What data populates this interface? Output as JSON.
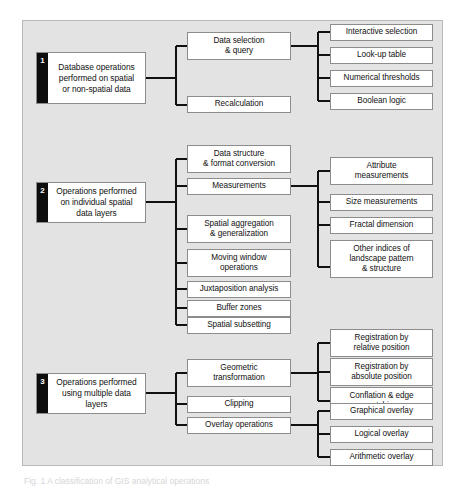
{
  "figure": {
    "caption": "Fig. 1  A classification of GIS analytical operations",
    "background_color": "#e3e3e3",
    "panel_border_color": "#b9b9b9",
    "node_fill": "#ffffff",
    "node_border": "#8c8c8c",
    "tab_color": "#0d0d0d",
    "connector_color": "#111111"
  },
  "sections": [
    {
      "number": "1",
      "title": "Database operations\nperformed on spatial\nor non-spatial data",
      "mid": [
        {
          "label": "Data selection\n& query"
        },
        {
          "label": "Recalculation"
        }
      ],
      "right": [
        {
          "label": "Interactive selection"
        },
        {
          "label": "Look-up table"
        },
        {
          "label": "Numerical thresholds"
        },
        {
          "label": "Boolean logic"
        }
      ]
    },
    {
      "number": "2",
      "title": "Operations performed\non individual spatial\ndata layers",
      "mid": [
        {
          "label": "Data structure\n& format conversion"
        },
        {
          "label": "Measurements"
        },
        {
          "label": "Spatial aggregation\n& generalization"
        },
        {
          "label": "Moving window\noperations"
        },
        {
          "label": "Juxtaposition analysis"
        },
        {
          "label": "Buffer zones"
        },
        {
          "label": "Spatial subsetting"
        }
      ],
      "right": [
        {
          "label": "Attribute\nmeasurements"
        },
        {
          "label": "Size measurements"
        },
        {
          "label": "Fractal dimension"
        },
        {
          "label": "Other indices of\nlandscape pattern\n& structure"
        }
      ]
    },
    {
      "number": "3",
      "title": "Operations performed\nusing multiple data\nlayers",
      "mid": [
        {
          "label": "Geometric\ntransformation"
        },
        {
          "label": "Clipping"
        },
        {
          "label": "Overlay operations"
        }
      ],
      "right": [
        {
          "label": "Registration by\nrelative position"
        },
        {
          "label": "Registration by\nabsolute position"
        },
        {
          "label": "Conflation & edge\nmatching"
        },
        {
          "label": "Graphical overlay"
        },
        {
          "label": "Logical overlay"
        },
        {
          "label": "Arithmetic overlay"
        }
      ]
    }
  ]
}
